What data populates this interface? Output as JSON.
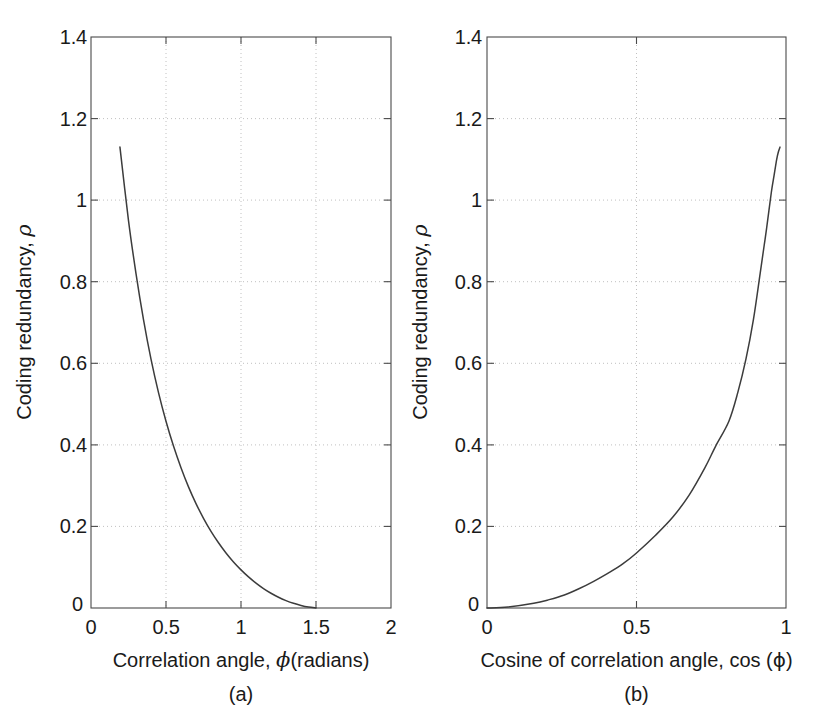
{
  "figure": {
    "background": "#ffffff",
    "line_color": "#3c3c3c",
    "grid_color": "#b9b9b9",
    "axis_color": "#4a4a4a"
  },
  "panels": [
    {
      "caption": "(a)",
      "ylabel_text": "Coding redundancy, ",
      "ylabel_symbol": "ρ",
      "xlabel_text": "Correlation angle, ",
      "xlabel_symbol": "ϕ",
      "xlabel_suffix": "(radians)",
      "xticks": [
        "0",
        "0.5",
        "1",
        "1.5",
        "2"
      ],
      "yticks": [
        "0",
        "0.2",
        "0.4",
        "0.6",
        "0.8",
        "1",
        "1.2",
        "1.4"
      ]
    },
    {
      "caption": "(b)",
      "ylabel_text": "Coding redundancy, ",
      "ylabel_symbol": "ρ",
      "xlabel_text": "Cosine of correlation angle, cos (",
      "xlabel_symbol": "ϕ",
      "xlabel_suffix": ")",
      "xticks": [
        "0",
        "0.5",
        "1"
      ],
      "yticks": [
        "0",
        "0.2",
        "0.4",
        "0.6",
        "0.8",
        "1",
        "1.2",
        "1.4"
      ]
    }
  ],
  "chart_data": [
    {
      "type": "line",
      "title": "",
      "xlabel": "Correlation angle, ϕ(radians)",
      "ylabel": "Coding redundancy, ρ",
      "xlim": [
        0,
        2
      ],
      "ylim": [
        0,
        1.4
      ],
      "xticks": [
        0,
        0.5,
        1,
        1.5,
        2
      ],
      "yticks": [
        0,
        0.2,
        0.4,
        0.6,
        0.8,
        1,
        1.2,
        1.4
      ],
      "grid": true,
      "legend": "none",
      "caption": "(a)",
      "x": [
        0.193,
        0.25,
        0.3,
        0.35,
        0.4,
        0.45,
        0.5,
        0.55,
        0.6,
        0.65,
        0.7,
        0.75,
        0.8,
        0.85,
        0.9,
        0.95,
        1.0,
        1.05,
        1.1,
        1.15,
        1.2,
        1.25,
        1.3,
        1.35,
        1.4,
        1.45,
        1.5
      ],
      "y": [
        1.13,
        0.95,
        0.82,
        0.707,
        0.61,
        0.528,
        0.458,
        0.397,
        0.344,
        0.297,
        0.256,
        0.22,
        0.188,
        0.16,
        0.135,
        0.113,
        0.0935,
        0.0762,
        0.061,
        0.0477,
        0.0362,
        0.0264,
        0.0182,
        0.0115,
        0.0063,
        0.0024,
        0.0
      ]
    },
    {
      "type": "line",
      "title": "",
      "xlabel": "Cosine of correlation angle, cos (ϕ)",
      "ylabel": "Coding redundancy, ρ",
      "xlim": [
        0,
        1
      ],
      "ylim": [
        0,
        1.4
      ],
      "xticks": [
        0,
        0.5,
        1
      ],
      "yticks": [
        0,
        0.2,
        0.4,
        0.6,
        0.8,
        1,
        1.2,
        1.4
      ],
      "grid": true,
      "legend": "none",
      "caption": "(b)",
      "x": [
        0.0,
        0.0707,
        0.1564,
        0.2079,
        0.2588,
        0.309,
        0.3584,
        0.4067,
        0.454,
        0.5,
        0.5646,
        0.6216,
        0.6755,
        0.729,
        0.7648,
        0.809,
        0.8387,
        0.866,
        0.891,
        0.9135,
        0.9272,
        0.935,
        0.9511,
        0.96,
        0.9689,
        0.9744,
        0.98
      ],
      "y": [
        0.0,
        0.0024,
        0.0115,
        0.0205,
        0.032,
        0.0477,
        0.066,
        0.086,
        0.108,
        0.135,
        0.179,
        0.223,
        0.276,
        0.344,
        0.397,
        0.458,
        0.528,
        0.61,
        0.707,
        0.82,
        0.89,
        0.93,
        1.02,
        1.06,
        1.1,
        1.118,
        1.13
      ]
    }
  ]
}
